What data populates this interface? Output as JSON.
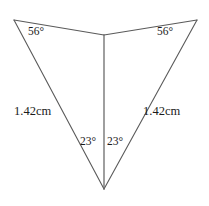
{
  "figure": {
    "background_color": "#ffffff",
    "stroke_color": "#5a5a5a",
    "text_color": "#1b1b1b",
    "stroke_width": 1,
    "canvas": {
      "width": 209,
      "height": 206
    }
  },
  "geometry": {
    "points": {
      "top_left": {
        "x": 14,
        "y": 20
      },
      "top_middle": {
        "x": 104,
        "y": 35
      },
      "top_right": {
        "x": 197,
        "y": 20
      },
      "bottom": {
        "x": 104,
        "y": 189
      }
    },
    "segments": [
      {
        "name": "edge-top-left",
        "from": "top_left",
        "to": "top_middle"
      },
      {
        "name": "edge-top-right",
        "from": "top_middle",
        "to": "top_right"
      },
      {
        "name": "edge-left-side",
        "from": "top_left",
        "to": "bottom"
      },
      {
        "name": "edge-right-side",
        "from": "top_right",
        "to": "bottom"
      },
      {
        "name": "edge-center-vertical",
        "from": "top_middle",
        "to": "bottom"
      }
    ]
  },
  "labels": {
    "angle_top_left": "56°",
    "angle_top_right": "56°",
    "angle_bottom_left": "23°",
    "angle_bottom_right": "23°",
    "side_left": "1.42cm",
    "side_right": "1.42cm"
  }
}
